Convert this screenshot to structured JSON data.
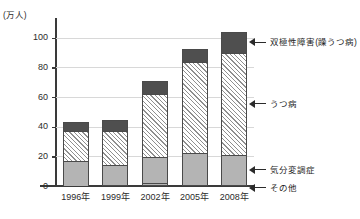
{
  "chart_data": {
    "type": "bar",
    "subtype": "stacked-bar",
    "title": "",
    "xlabel": "",
    "ylabel": "(万人)",
    "unit_label": "(万人)",
    "ylim": [
      0,
      110
    ],
    "yticks": [
      0,
      20,
      40,
      60,
      80,
      100
    ],
    "ytick_labels": [
      "0",
      "20",
      "40",
      "60",
      "80",
      "100"
    ],
    "grid": true,
    "grid_axis": "y",
    "legend_position": "right-callouts",
    "categories": [
      "1996年",
      "1999年",
      "2002年",
      "2005年",
      "2008年"
    ],
    "series": [
      {
        "name": "その他",
        "label": "その他",
        "color": "#b4b4b4",
        "pattern": "solid-gray",
        "values": [
          0.3,
          0.4,
          2.0,
          0.5,
          1.0
        ]
      },
      {
        "name": "気分変調症",
        "label": "気分変調症",
        "color": "#b4b4b4",
        "pattern": "solid-gray",
        "values": [
          16.7,
          13.6,
          17.5,
          21.5,
          20.0
        ]
      },
      {
        "name": "うつ病",
        "label": "うつ病",
        "color": "#ffffff",
        "pattern": "diagonal-hatch",
        "values": [
          20.0,
          22.9,
          42.5,
          61.5,
          69.0
        ]
      },
      {
        "name": "双極性障害(躁うつ病)",
        "label": "双極性障害(躁うつ病)",
        "color": "#4f4f4f",
        "pattern": "solid-dark",
        "values": [
          6.3,
          7.6,
          9.1,
          8.9,
          14.1
        ]
      }
    ],
    "totals": [
      43.3,
      44.5,
      71.1,
      92.4,
      104.1
    ],
    "cumulative": {
      "1996年": {
        "その他": 0.3,
        "気分変調症": 17.0,
        "うつ病": 37.0,
        "双極性障害(躁うつ病)": 43.3
      },
      "1999年": {
        "その他": 0.4,
        "気分変調症": 14.0,
        "うつ病": 36.9,
        "双極性障害(躁うつ病)": 44.5
      },
      "2002年": {
        "その他": 2.0,
        "気分変調症": 19.5,
        "うつ病": 62.0,
        "双極性障害(躁うつ病)": 71.1
      },
      "2005年": {
        "その他": 0.5,
        "気分変調症": 22.0,
        "うつ病": 83.5,
        "双極性障害(躁うつ病)": 92.4
      },
      "2008年": {
        "その他": 1.0,
        "気分変調症": 21.0,
        "うつ病": 90.0,
        "双極性障害(躁うつ病)": 104.1
      }
    },
    "callouts": [
      {
        "label": "双極性障害(躁うつ病)",
        "target_series": "双極性障害(躁うつ病)"
      },
      {
        "label": "うつ病",
        "target_series": "うつ病"
      },
      {
        "label": "気分変調症",
        "target_series": "気分変調症"
      },
      {
        "label": "その他",
        "target_series": "その他"
      }
    ]
  }
}
